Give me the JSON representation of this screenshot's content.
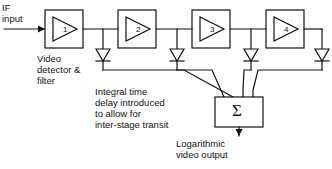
{
  "diagram": {
    "title_text_blocks": {
      "if_input": "IF\ninput",
      "video_detector": "Video\ndetector &\nfilter",
      "integral_delay": "Integral time\ndelay introduced\nto allow for\ninter-stage transit",
      "log_output": "Logarithmic\nvideo output"
    },
    "amplifiers": [
      {
        "label": "1",
        "x": 45,
        "y": 10,
        "w": 38,
        "h": 38
      },
      {
        "label": "2",
        "x": 118,
        "y": 10,
        "w": 38,
        "h": 38
      },
      {
        "label": "3",
        "x": 192,
        "y": 10,
        "w": 38,
        "h": 38
      },
      {
        "label": "4",
        "x": 266,
        "y": 10,
        "w": 38,
        "h": 38
      }
    ],
    "summer": {
      "symbol": "Σ",
      "x": 215,
      "y": 97,
      "w": 48,
      "h": 30
    },
    "diodes": [
      {
        "x": 103,
        "y": 49
      },
      {
        "x": 177,
        "y": 49
      },
      {
        "x": 251,
        "y": 49
      },
      {
        "x": 322,
        "y": 49
      }
    ],
    "signal_line_y": 29,
    "colors": {
      "stroke": "#121212",
      "text": "#121212",
      "background": "#ffffff"
    }
  }
}
